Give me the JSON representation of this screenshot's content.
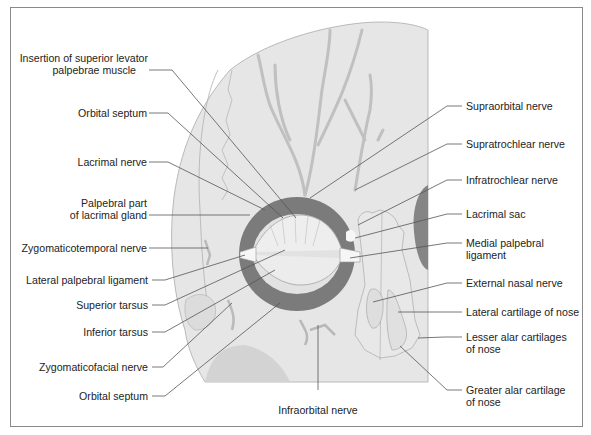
{
  "figure": {
    "colors": {
      "background": "#ffffff",
      "frame": "#8a8a8a",
      "skin": "#e4e4e4",
      "skin_outline": "#a8a8a8",
      "muscle": "#7b7b7b",
      "nerve": "#c2c2c2",
      "leader": "#555555",
      "text": "#232323"
    },
    "labels_left": [
      {
        "id": "insertion-superior-levator",
        "line1": "Insertion of superior levator",
        "line2": "palpebrae muscle"
      },
      {
        "id": "orbital-septum-upper",
        "line1": "Orbital septum"
      },
      {
        "id": "lacrimal-nerve",
        "line1": "Lacrimal nerve"
      },
      {
        "id": "palpebral-lacrimal-gland",
        "line1": "Palpebral part",
        "line2": "of lacrimal gland"
      },
      {
        "id": "zygomaticotemporal-nerve",
        "line1": "Zygomaticotemporal nerve"
      },
      {
        "id": "lateral-palpebral-ligament",
        "line1": "Lateral palpebral ligament"
      },
      {
        "id": "superior-tarsus",
        "line1": "Superior tarsus"
      },
      {
        "id": "inferior-tarsus",
        "line1": "Inferior tarsus"
      },
      {
        "id": "zygomaticofacial-nerve",
        "line1": "Zygomaticofacial nerve"
      },
      {
        "id": "orbital-septum-lower",
        "line1": "Orbital septum"
      }
    ],
    "labels_right": [
      {
        "id": "supraorbital-nerve",
        "line1": "Supraorbital nerve"
      },
      {
        "id": "supratrochlear-nerve",
        "line1": "Supratrochlear nerve"
      },
      {
        "id": "infratrochlear-nerve",
        "line1": "Infratrochlear nerve"
      },
      {
        "id": "lacrimal-sac",
        "line1": "Lacrimal sac"
      },
      {
        "id": "medial-palpebral-ligament",
        "line1": "Medial palpebral",
        "line2": "ligament"
      },
      {
        "id": "external-nasal-nerve",
        "line1": "External nasal nerve"
      },
      {
        "id": "lateral-cartilage-nose",
        "line1": "Lateral cartilage of nose"
      },
      {
        "id": "lesser-alar-cartilages",
        "line1": "Lesser alar cartilages",
        "line2": "of nose"
      },
      {
        "id": "greater-alar-cartilage",
        "line1": "Greater alar cartilage",
        "line2": "of nose"
      }
    ],
    "labels_bottom": [
      {
        "id": "infraorbital-nerve",
        "line1": "Infraorbital nerve"
      }
    ]
  }
}
